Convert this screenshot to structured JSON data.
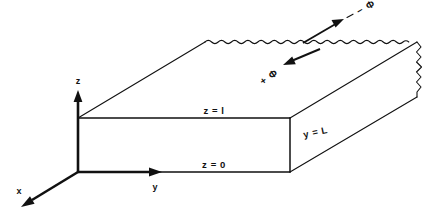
{
  "figure": {
    "type": "3d-slab-geometry-diagram",
    "background_color": "#ffffff",
    "line_color": "#111111"
  },
  "axes": {
    "origin_label": "",
    "z_label": "z",
    "y_label": "y",
    "x_label": "x"
  },
  "surface_labels": {
    "top_plane": "z = l",
    "bottom_plane": "z = 0",
    "side_plane": "y = L"
  },
  "flux_arrows": [
    {
      "name": "incoming-flux",
      "label": "+ Φ",
      "direction": "into-surface",
      "sign": "+"
    },
    {
      "name": "outgoing-flux",
      "label": "− Φ",
      "direction": "out-of-surface",
      "sign": "−"
    }
  ],
  "geometry_notes": {
    "back_edge_style": "wavy",
    "right_edge_style": "jagged-torn"
  }
}
